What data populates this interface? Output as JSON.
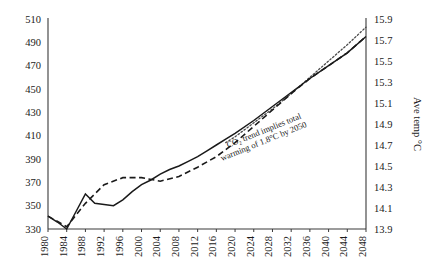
{
  "chart_data": {
    "type": "line",
    "title": "",
    "xlabel": "",
    "ylabel": "",
    "y2label": "Ave temp °C",
    "xlim": [
      1980,
      2048
    ],
    "ylim": [
      330,
      510
    ],
    "y2lim": [
      13.9,
      15.9
    ],
    "grid": false,
    "legend": "none",
    "x_tick_labels": [
      "1980",
      "1984",
      "1988",
      "1992",
      "1996",
      "2000",
      "2004",
      "2008",
      "2012",
      "2016",
      "2020",
      "2024",
      "2028",
      "2032",
      "2036",
      "2040",
      "2044",
      "2048"
    ],
    "y_tick_labels": [
      "330",
      "350",
      "370",
      "390",
      "410",
      "430",
      "450",
      "470",
      "490",
      "510"
    ],
    "y2_tick_labels": [
      "13.9",
      "14.1",
      "14.3",
      "14.5",
      "14.7",
      "14.9",
      "15.1",
      "15.3",
      "15.5",
      "15.7",
      "15.9"
    ],
    "annotations": [
      {
        "text": "CO₂ trend implies total warming of 1.8°C by 2050",
        "line1": "CO₂ trend implies total",
        "line2": "warming of 1.8°C by 2050",
        "rotation_deg": -22
      }
    ],
    "series": [
      {
        "name": "Ave temp °C (observed)",
        "style": "solid",
        "axis": "right",
        "x": [
          1980,
          1982,
          1984,
          1986,
          1988,
          1990,
          1992,
          1994,
          1996,
          1998,
          2000,
          2002,
          2004,
          2006,
          2008,
          2010,
          2012,
          2014,
          2016,
          2018,
          2020,
          2024,
          2028,
          2032,
          2036,
          2040,
          2044,
          2048
        ],
        "values_ppm_scale": [
          341,
          336,
          330,
          345,
          360,
          352,
          351,
          350,
          355,
          362,
          368,
          372,
          377,
          381,
          384,
          388,
          392,
          397,
          402,
          407,
          412,
          423,
          435,
          447,
          459,
          470,
          481,
          495
        ],
        "values": [
          13.92,
          13.87,
          13.8,
          13.97,
          14.23,
          14.14,
          14.13,
          14.12,
          14.18,
          14.26,
          14.32,
          14.37,
          14.42,
          14.47,
          14.5,
          14.54,
          14.59,
          14.64,
          14.7,
          14.76,
          14.81,
          14.93,
          15.07,
          15.2,
          15.33,
          15.46,
          15.58,
          15.73
        ]
      },
      {
        "name": "CO₂ ppm trend",
        "style": "dashed",
        "axis": "left",
        "x": [
          1980,
          1984,
          1988,
          1992,
          1996,
          2000,
          2004,
          2008,
          2012,
          2016,
          2020,
          2024,
          2028,
          2032,
          2036,
          2040,
          2044,
          2048
        ],
        "values": [
          341,
          332,
          352,
          368,
          374,
          374,
          371,
          375,
          383,
          392,
          404,
          418,
          432,
          446,
          459,
          470,
          481,
          495
        ]
      },
      {
        "name": "CO₂ upper projection",
        "style": "dotted",
        "axis": "left",
        "x": [
          2018,
          2020,
          2024,
          2028,
          2032,
          2036,
          2040,
          2044,
          2048
        ],
        "values": [
          404,
          409,
          421,
          433,
          446,
          460,
          474,
          488,
          503
        ]
      }
    ]
  },
  "axis": {
    "right_title": "Ave temp °C"
  }
}
